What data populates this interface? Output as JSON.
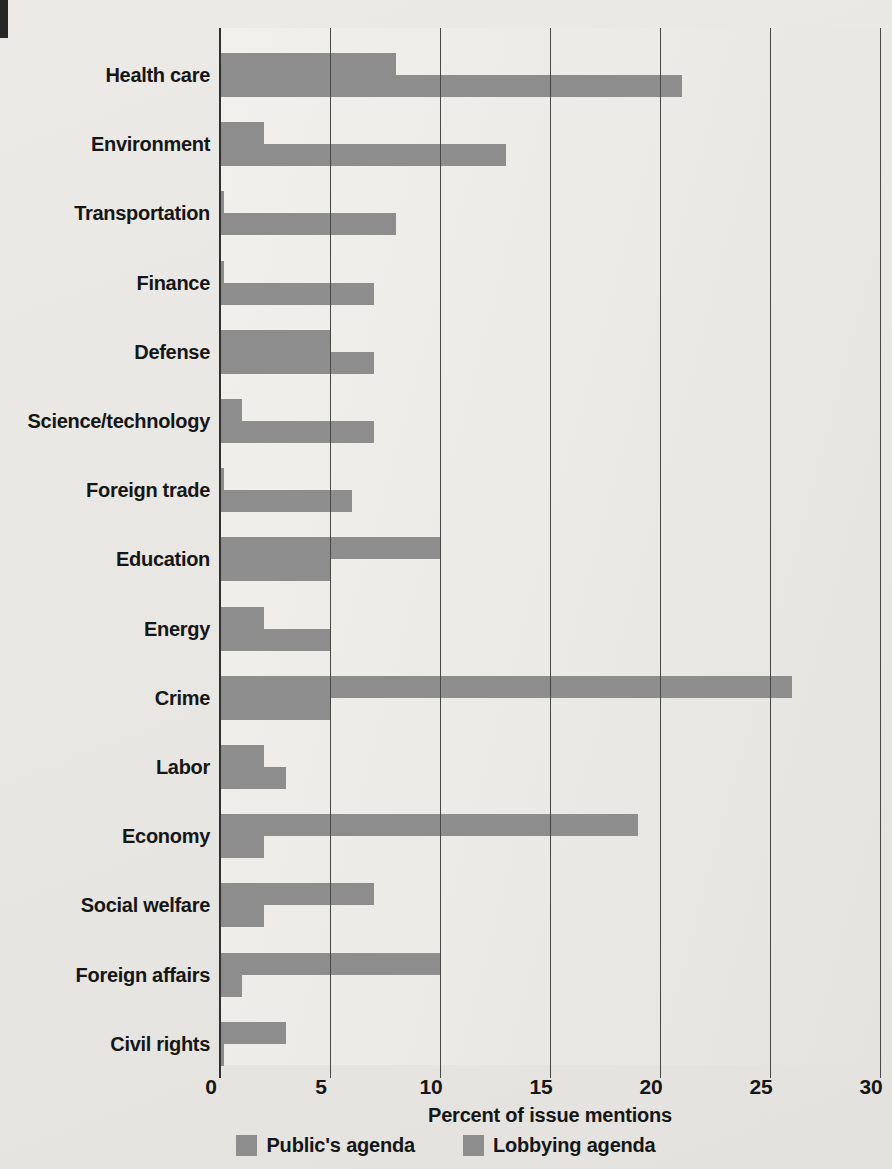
{
  "chart_data": {
    "type": "bar",
    "orientation": "horizontal",
    "categories": [
      "Health care",
      "Environment",
      "Transportation",
      "Finance",
      "Defense",
      "Science/technology",
      "Foreign trade",
      "Education",
      "Energy",
      "Crime",
      "Labor",
      "Economy",
      "Social welfare",
      "Foreign affairs",
      "Civil rights"
    ],
    "series": [
      {
        "name": "Public's agenda",
        "pair_position": "top",
        "values": [
          8,
          2,
          0.2,
          0.2,
          5,
          1,
          0.2,
          10,
          2,
          26,
          2,
          19,
          7,
          10,
          3
        ]
      },
      {
        "name": "Lobbying agenda",
        "pair_position": "bottom",
        "values": [
          21,
          13,
          8,
          7,
          7,
          7,
          6,
          5,
          5,
          5,
          3,
          2,
          2,
          1,
          0.2
        ]
      }
    ],
    "title": "",
    "xlabel": "Percent of issue mentions",
    "ylabel": "",
    "xlim": [
      0,
      30
    ],
    "xticks": [
      0,
      5,
      10,
      15,
      20,
      25,
      30
    ],
    "grid": "vertical",
    "legend_position": "bottom"
  },
  "colors": {
    "bar": "#8d8d8d",
    "gridline": "#474745",
    "zero_axis_line": "#30302e",
    "text": "#161616",
    "page_background": "#e8e7e3",
    "plot_background": "#ebeae6"
  }
}
